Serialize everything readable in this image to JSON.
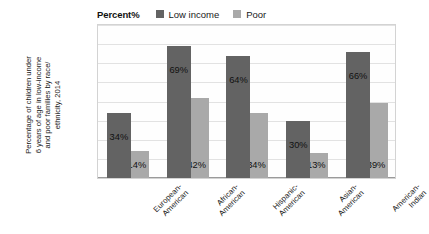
{
  "header": {
    "percent_title": "Percent%"
  },
  "legend": {
    "position": "top",
    "items": [
      {
        "label": "Low income",
        "color": "#636363",
        "swatch_icon": "square-swatch-icon"
      },
      {
        "label": "Poor",
        "color": "#a9a9a9",
        "swatch_icon": "square-swatch-icon"
      }
    ]
  },
  "y_axis": {
    "title_lines": [
      "Percentage of children under",
      "6 years of age in low-income",
      "and poor families by race/",
      "ethnicity, 2014"
    ],
    "ticks": [
      "80",
      "70",
      "60",
      "50",
      "40",
      "30",
      "20",
      "10",
      "0"
    ],
    "min": 0,
    "max": 80,
    "step": 10
  },
  "x_axis": {
    "categories": [
      {
        "lines": [
          "European-",
          "American"
        ],
        "full": "European-American"
      },
      {
        "lines": [
          "African-",
          "American"
        ],
        "full": "African-American"
      },
      {
        "lines": [
          "Hispanic-",
          "American"
        ],
        "full": "Hispanic-American"
      },
      {
        "lines": [
          "Asian-",
          "American"
        ],
        "full": "Asian-American"
      },
      {
        "lines": [
          "American-",
          "Indian"
        ],
        "full": "American-Indian"
      }
    ]
  },
  "bars": [
    {
      "category": "European-American",
      "low_income": 34,
      "poor": 14,
      "low_income_label": "34%",
      "poor_label": "14%"
    },
    {
      "category": "African-American",
      "low_income": 69,
      "poor": 42,
      "low_income_label": "69%",
      "poor_label": "42%"
    },
    {
      "category": "Hispanic-American",
      "low_income": 64,
      "poor": 34,
      "low_income_label": "64%",
      "poor_label": "34%"
    },
    {
      "category": "Asian-American",
      "low_income": 30,
      "poor": 13,
      "low_income_label": "30%",
      "poor_label": "13%"
    },
    {
      "category": "American-Indian",
      "low_income": 66,
      "poor": 39,
      "low_income_label": "66%",
      "poor_label": "39%"
    }
  ],
  "chart_data": {
    "type": "bar",
    "title": "Percent%",
    "xlabel": "",
    "ylabel": "Percentage of children under 6 years of age in low-income and poor families by race/ethnicity, 2014",
    "categories": [
      "European-American",
      "African-American",
      "Hispanic-American",
      "Asian-American",
      "American-Indian"
    ],
    "series": [
      {
        "name": "Low income",
        "values": [
          34,
          69,
          64,
          30,
          66
        ],
        "color": "#636363"
      },
      {
        "name": "Poor",
        "values": [
          14,
          42,
          34,
          13,
          39
        ],
        "color": "#a9a9a9"
      }
    ],
    "data_labels": [
      [
        "34%",
        "69%",
        "64%",
        "30%",
        "66%"
      ],
      [
        "14%",
        "42%",
        "34%",
        "13%",
        "39%"
      ]
    ],
    "ylim": [
      0,
      80
    ],
    "ytick_step": 10,
    "yticks": [
      0,
      10,
      20,
      30,
      40,
      50,
      60,
      70,
      80
    ],
    "grid": "horizontal",
    "legend_position": "top",
    "units": "percent"
  }
}
